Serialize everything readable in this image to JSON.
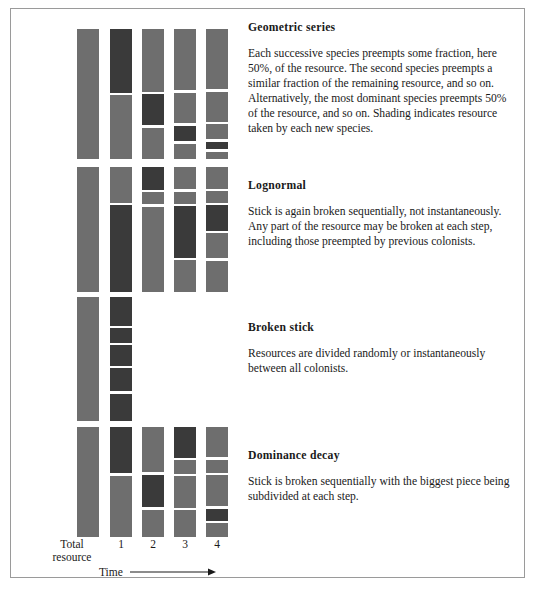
{
  "figure": {
    "axis": {
      "total_label_line1": "Total",
      "total_label_line2": "resource",
      "ticks": [
        "1",
        "2",
        "3",
        "4"
      ],
      "time_label": "Time",
      "time_arrow_icon": "right-arrow-icon"
    },
    "colors": {
      "background": "#ffffff",
      "frame_border": "#9a9a9a",
      "segment_existing": "#6e6e6e",
      "segment_new": "#3a3a3a",
      "text": "#1a1a1a"
    },
    "models": [
      {
        "id": "geometric-series",
        "title": "Geometric series",
        "body": "Each successive species preempts some fraction, here 50%, of the resource. The second species preempts a similar fraction of the remaining resource, and so on. Alternatively, the most dominant species preempts 50% of the resource, and so on. Shading indicates resource taken by each new species.",
        "columns": [
          {
            "name": "total-resource",
            "segments": [
              {
                "size": 100,
                "shade": "light"
              }
            ]
          },
          {
            "name": "time-1",
            "segments": [
              {
                "size": 50,
                "shade": "dark"
              },
              {
                "size": 50,
                "shade": "light"
              }
            ]
          },
          {
            "name": "time-2",
            "segments": [
              {
                "size": 50,
                "shade": "light"
              },
              {
                "size": 25,
                "shade": "dark"
              },
              {
                "size": 25,
                "shade": "light"
              }
            ]
          },
          {
            "name": "time-3",
            "segments": [
              {
                "size": 50,
                "shade": "light"
              },
              {
                "size": 25,
                "shade": "light"
              },
              {
                "size": 12.5,
                "shade": "dark"
              },
              {
                "size": 12.5,
                "shade": "light"
              }
            ]
          },
          {
            "name": "time-4",
            "segments": [
              {
                "size": 50,
                "shade": "light"
              },
              {
                "size": 25,
                "shade": "light"
              },
              {
                "size": 12.5,
                "shade": "light"
              },
              {
                "size": 6.25,
                "shade": "dark"
              },
              {
                "size": 6.25,
                "shade": "light"
              }
            ]
          }
        ]
      },
      {
        "id": "lognormal",
        "title": "Lognormal",
        "body": "Stick is again broken sequentially, not instantaneously. Any part of the resource may be broken at each step, including those preempted by previous colonists.",
        "columns": [
          {
            "name": "total-resource",
            "segments": [
              {
                "size": 100,
                "shade": "light"
              }
            ]
          },
          {
            "name": "time-1",
            "segments": [
              {
                "size": 29,
                "shade": "light"
              },
              {
                "size": 71,
                "shade": "dark"
              }
            ]
          },
          {
            "name": "time-2",
            "segments": [
              {
                "size": 19,
                "shade": "dark"
              },
              {
                "size": 10,
                "shade": "light"
              },
              {
                "size": 71,
                "shade": "light"
              }
            ]
          },
          {
            "name": "time-3",
            "segments": [
              {
                "size": 19,
                "shade": "light"
              },
              {
                "size": 10,
                "shade": "light"
              },
              {
                "size": 44,
                "shade": "dark"
              },
              {
                "size": 27,
                "shade": "light"
              }
            ]
          },
          {
            "name": "time-4",
            "segments": [
              {
                "size": 19,
                "shade": "light"
              },
              {
                "size": 10,
                "shade": "light"
              },
              {
                "size": 22,
                "shade": "dark"
              },
              {
                "size": 22,
                "shade": "light"
              },
              {
                "size": 27,
                "shade": "light"
              }
            ]
          }
        ]
      },
      {
        "id": "broken-stick",
        "title": "Broken stick",
        "body": "Resources are divided randomly or instantaneously between all colonists.",
        "columns": [
          {
            "name": "total-resource",
            "segments": [
              {
                "size": 100,
                "shade": "light"
              }
            ]
          },
          {
            "name": "time-1",
            "segments": [
              {
                "size": 25,
                "shade": "dark"
              },
              {
                "size": 13,
                "shade": "dark"
              },
              {
                "size": 18,
                "shade": "dark"
              },
              {
                "size": 20,
                "shade": "dark"
              },
              {
                "size": 24,
                "shade": "dark"
              }
            ]
          },
          {
            "name": "time-2",
            "segments": []
          },
          {
            "name": "time-3",
            "segments": []
          },
          {
            "name": "time-4",
            "segments": []
          }
        ]
      },
      {
        "id": "dominance-decay",
        "title": "Dominance decay",
        "body": "Stick is broken sequentially with the biggest piece being subdivided at each step.",
        "columns": [
          {
            "name": "total-resource",
            "segments": [
              {
                "size": 100,
                "shade": "light"
              }
            ]
          },
          {
            "name": "time-1",
            "segments": [
              {
                "size": 43,
                "shade": "dark"
              },
              {
                "size": 57,
                "shade": "light"
              }
            ]
          },
          {
            "name": "time-2",
            "segments": [
              {
                "size": 43,
                "shade": "light"
              },
              {
                "size": 31,
                "shade": "dark"
              },
              {
                "size": 26,
                "shade": "light"
              }
            ]
          },
          {
            "name": "time-3",
            "segments": [
              {
                "size": 30,
                "shade": "dark"
              },
              {
                "size": 13,
                "shade": "light"
              },
              {
                "size": 31,
                "shade": "light"
              },
              {
                "size": 26,
                "shade": "light"
              }
            ]
          },
          {
            "name": "time-4",
            "segments": [
              {
                "size": 30,
                "shade": "light"
              },
              {
                "size": 13,
                "shade": "light"
              },
              {
                "size": 31,
                "shade": "light"
              },
              {
                "size": 12,
                "shade": "dark"
              },
              {
                "size": 14,
                "shade": "light"
              }
            ]
          }
        ]
      }
    ],
    "layout": {
      "column_x": [
        66,
        99,
        131,
        163,
        195
      ],
      "blocks": [
        {
          "top": 20,
          "height": 130,
          "text_top": 12
        },
        {
          "top": 158,
          "height": 125,
          "text_top": 170
        },
        {
          "top": 288,
          "height": 124,
          "text_top": 312
        },
        {
          "top": 418,
          "height": 110,
          "text_top": 440
        }
      ]
    }
  }
}
